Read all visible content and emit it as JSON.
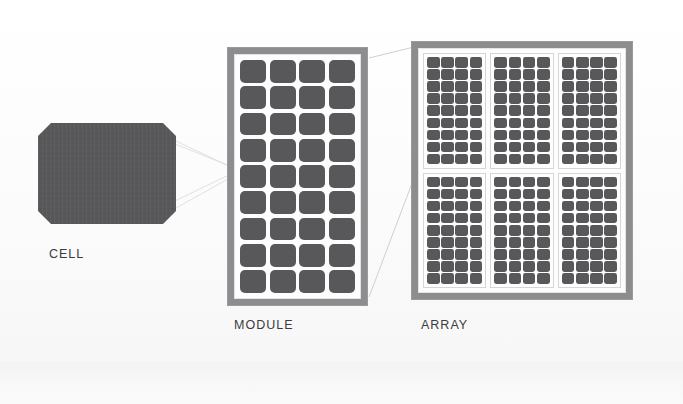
{
  "diagram": {
    "background_color": "#fbfbfb",
    "cell_color": "#58585b",
    "frame_color": "#8d8d8f",
    "inner_color": "#fdfdfd",
    "label_color": "#3b3b3d",
    "connector_color": "#d8d8d8"
  },
  "stages": {
    "cell": {
      "label": "CELL",
      "shape": "octagon",
      "fill": "#58585b",
      "width_px": 138,
      "height_px": 101,
      "corner_chamfer_px": 13
    },
    "module": {
      "label": "MODULE",
      "columns": 4,
      "rows": 9,
      "cell_count": 36,
      "frame_fill": "#8d8d8f",
      "laminate_fill": "#fdfdfd"
    },
    "array": {
      "label": "ARRAY",
      "module_columns": 3,
      "module_rows": 2,
      "module_count": 6,
      "cells_per_module": 36,
      "sub_module_columns": 4,
      "sub_module_rows": 9,
      "total_cell_count": 216,
      "frame_fill": "#8d8d8f",
      "laminate_fill": "#fdfdfd"
    }
  },
  "connectors": [
    {
      "name": "cell-to-module-top",
      "from": "cell.top-right",
      "to": "module.left-upper"
    },
    {
      "name": "cell-to-module-bottom",
      "from": "cell.bottom-right",
      "to": "module.left-lower"
    },
    {
      "name": "module-to-array-top",
      "from": "module.top-right",
      "to": "array.top-left"
    },
    {
      "name": "module-to-array-bottom",
      "from": "module.bottom-right",
      "to": "array.mid-left"
    }
  ]
}
